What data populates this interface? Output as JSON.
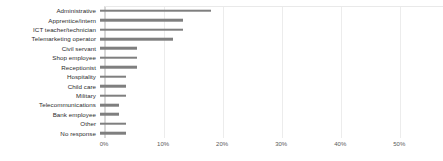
{
  "chart_data": {
    "type": "bar",
    "orientation": "horizontal",
    "title": "",
    "subtitle": "",
    "xlabel": "",
    "ylabel": "",
    "xlim": [
      0,
      57.4
    ],
    "grid": true,
    "legend": false,
    "legend_position": "none",
    "bar_color": "#7f7f7f",
    "gridline_color": "#ececec",
    "axis_tick_labels": [
      "0%",
      "10%",
      "20%",
      "30%",
      "40%",
      "50%"
    ],
    "axis_tick_values": [
      0,
      10,
      20,
      30,
      40,
      50
    ],
    "categories": [
      "Administrative",
      "Apprentice/intern",
      "ICT teacher/technician",
      "Telemarketing operator",
      "Civil servant",
      "Shop employee",
      "Receptionist",
      "Hospitality",
      "Child care",
      "Military",
      "Telecommunications",
      "Bank employee",
      "Other",
      "No response"
    ],
    "values": [
      18.8,
      14.1,
      14.1,
      12.4,
      6.3,
      6.3,
      6.3,
      4.4,
      4.4,
      4.4,
      3.2,
      3.2,
      4.4,
      4.4
    ]
  }
}
